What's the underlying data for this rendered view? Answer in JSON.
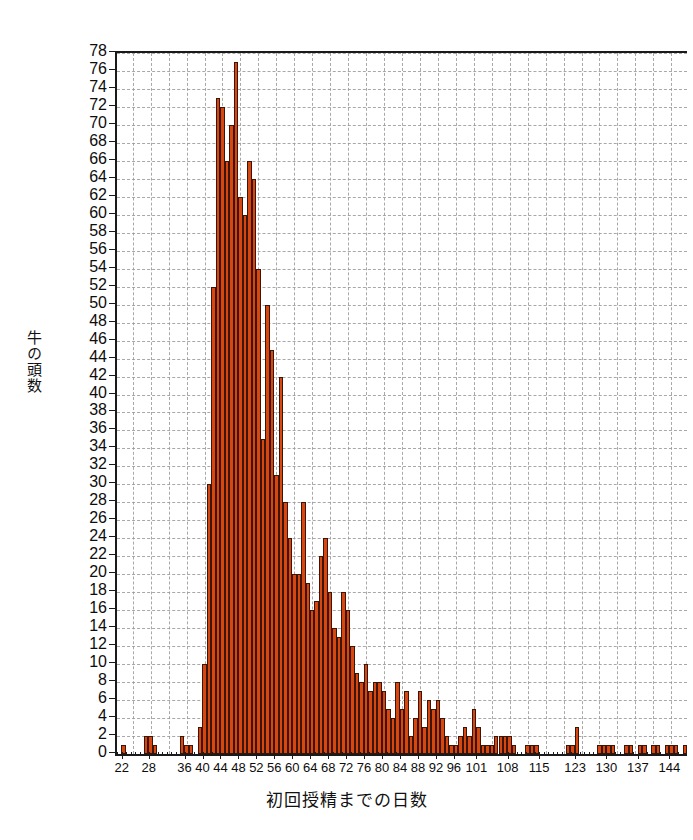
{
  "chart_data": {
    "type": "bar",
    "title": "",
    "xlabel": "初回授精までの日数",
    "ylabel": "牛の頭数",
    "xlim": [
      21,
      147
    ],
    "ylim": [
      0,
      78
    ],
    "grid": true,
    "legend": null,
    "bar_color": "#d8470f",
    "bar_edge_color": "#3b1608",
    "bin_width_days": 1,
    "y_tick_step": 2,
    "y_ticks": [
      0,
      2,
      4,
      6,
      8,
      10,
      12,
      14,
      16,
      18,
      20,
      22,
      24,
      26,
      28,
      30,
      32,
      34,
      36,
      38,
      40,
      42,
      44,
      46,
      48,
      50,
      52,
      54,
      56,
      58,
      60,
      62,
      64,
      66,
      68,
      70,
      72,
      74,
      76,
      78
    ],
    "x_ticks": [
      22,
      28,
      36,
      40,
      44,
      48,
      52,
      56,
      60,
      64,
      68,
      72,
      76,
      80,
      84,
      88,
      92,
      96,
      101,
      108,
      115,
      123,
      130,
      137,
      144
    ],
    "categories": [
      21,
      22,
      23,
      24,
      25,
      26,
      27,
      28,
      29,
      30,
      31,
      32,
      33,
      34,
      35,
      36,
      37,
      38,
      39,
      40,
      41,
      42,
      43,
      44,
      45,
      46,
      47,
      48,
      49,
      50,
      51,
      52,
      53,
      54,
      55,
      56,
      57,
      58,
      59,
      60,
      61,
      62,
      63,
      64,
      65,
      66,
      67,
      68,
      69,
      70,
      71,
      72,
      73,
      74,
      75,
      76,
      77,
      78,
      79,
      80,
      81,
      82,
      83,
      84,
      85,
      86,
      87,
      88,
      89,
      90,
      91,
      92,
      93,
      94,
      95,
      96,
      97,
      98,
      99,
      100,
      101,
      102,
      103,
      104,
      105,
      106,
      107,
      108,
      109,
      110,
      111,
      112,
      113,
      114,
      115,
      116,
      117,
      118,
      119,
      120,
      121,
      122,
      123,
      124,
      125,
      126,
      127,
      128,
      129,
      130,
      131,
      132,
      133,
      134,
      135,
      136,
      137,
      138,
      139,
      140,
      141,
      142,
      143,
      144,
      145,
      146,
      147
    ],
    "values": [
      0,
      1,
      0,
      0,
      0,
      0,
      2,
      2,
      1,
      0,
      0,
      0,
      0,
      0,
      2,
      1,
      1,
      0,
      3,
      10,
      30,
      52,
      73,
      72,
      66,
      70,
      77,
      62,
      60,
      66,
      64,
      54,
      35,
      50,
      45,
      31,
      42,
      28,
      24,
      20,
      20,
      28,
      19,
      16,
      17,
      22,
      24,
      18,
      14,
      13,
      18,
      16,
      12,
      9,
      8,
      10,
      7,
      8,
      8,
      7,
      5,
      4,
      8,
      5,
      7,
      2,
      4,
      7,
      3,
      6,
      5,
      6,
      4,
      2,
      1,
      1,
      2,
      3,
      2,
      5,
      3,
      1,
      1,
      1,
      2,
      2,
      2,
      2,
      1,
      0,
      0,
      1,
      1,
      1,
      0,
      0,
      0,
      0,
      0,
      0,
      1,
      1,
      3,
      0,
      0,
      0,
      0,
      1,
      1,
      1,
      1,
      0,
      0,
      1,
      1,
      0,
      1,
      1,
      0,
      1,
      1,
      0,
      1,
      1,
      1,
      0,
      1
    ]
  },
  "axis": {
    "y_title": "牛の頭数",
    "x_title": "初回授精までの日数"
  }
}
